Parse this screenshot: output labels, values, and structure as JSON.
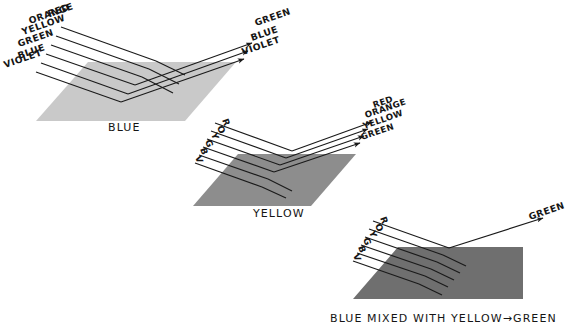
{
  "figure": {
    "title_text": "",
    "background": "#ffffff",
    "ink": "#151515"
  },
  "panels": [
    {
      "id": "blue-surface",
      "caption": "BLUE",
      "surface_color": "#c8c8c8",
      "incoming_labels": [
        "RED",
        "ORANGE",
        "YELLOW",
        "GREEN",
        "BLUE",
        "VIOLET"
      ],
      "outgoing_labels": [
        "GREEN",
        "BLUE",
        "VIOLET"
      ],
      "absorbed_labels": [
        "RED",
        "ORANGE",
        "YELLOW"
      ]
    },
    {
      "id": "yellow-surface",
      "caption": "YELLOW",
      "surface_color": "#8c8c8c",
      "incoming_labels": [
        "R",
        "O",
        "Y",
        "G",
        "B",
        "V"
      ],
      "outgoing_labels": [
        "RED",
        "ORANGE",
        "YELLOW",
        "GREEN"
      ],
      "absorbed_labels": [
        "BLUE",
        "VIOLET"
      ]
    },
    {
      "id": "blue-mixed-with-yellow-surface",
      "caption": "BLUE MIXED WITH YELLOW→GREEN",
      "surface_color": "#6e6e6e",
      "incoming_labels": [
        "R",
        "O",
        "Y",
        "G",
        "B",
        "V"
      ],
      "outgoing_labels": [
        "GREEN"
      ],
      "absorbed_labels": [
        "RED",
        "ORANGE",
        "YELLOW",
        "BLUE",
        "VIOLET"
      ]
    }
  ],
  "icons": {
    "arrowhead": "arrow-head-icon",
    "ray": "light-ray-icon"
  }
}
